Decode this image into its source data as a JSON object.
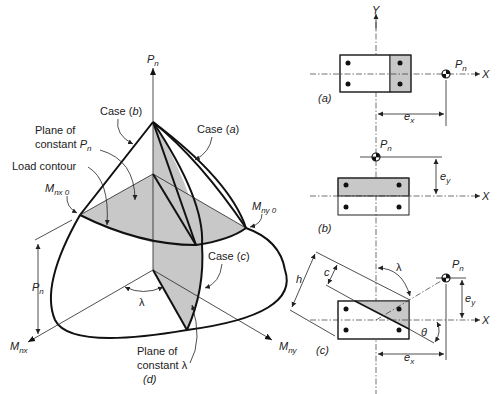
{
  "figure": {
    "main": {
      "caption": "(d)",
      "axis_vertical": "P",
      "axis_vertical_sub": "n",
      "axis_x": "M",
      "axis_x_sub": "nx",
      "axis_y": "M",
      "axis_y_sub": "ny",
      "labels": {
        "case_a": "Case (",
        "case_a_letter": "a",
        "case_b": "Case (",
        "case_b_letter": "b",
        "case_c": "Case (",
        "case_c_letter": "c",
        "close_paren": ")",
        "plane_pn_line1": "Plane of",
        "plane_pn_line2": "constant ",
        "plane_pn_var": "P",
        "plane_pn_sub": "n",
        "load_contour": "Load contour",
        "mnx0": "M",
        "mnx0_sub": "nx 0",
        "mny0": "M",
        "mny0_sub": "ny 0",
        "pn_dim": "P",
        "pn_dim_sub": "n",
        "lambda": "λ",
        "plane_lambda_line1": "Plane of",
        "plane_lambda_line2": "constant λ"
      }
    },
    "section_a": {
      "caption": "(a)",
      "axis_y": "Y",
      "axis_x": "X",
      "load": "P",
      "load_sub": "n",
      "ecc": "e",
      "ecc_sub": "x"
    },
    "section_b": {
      "caption": "(b)",
      "axis_x": "X",
      "load": "P",
      "load_sub": "n",
      "ecc": "e",
      "ecc_sub": "y"
    },
    "section_c": {
      "caption": "(c)",
      "axis_x": "X",
      "load": "P",
      "load_sub": "n",
      "ecc_x": "e",
      "ecc_x_sub": "x",
      "ecc_y": "e",
      "ecc_y_sub": "y",
      "depth": "h",
      "neutral_depth": "c",
      "angle_lambda": "λ",
      "angle_theta": "θ"
    },
    "colors": {
      "compression_zone": "#c8c8c8",
      "line": "#111111",
      "background": "#ffffff"
    }
  }
}
